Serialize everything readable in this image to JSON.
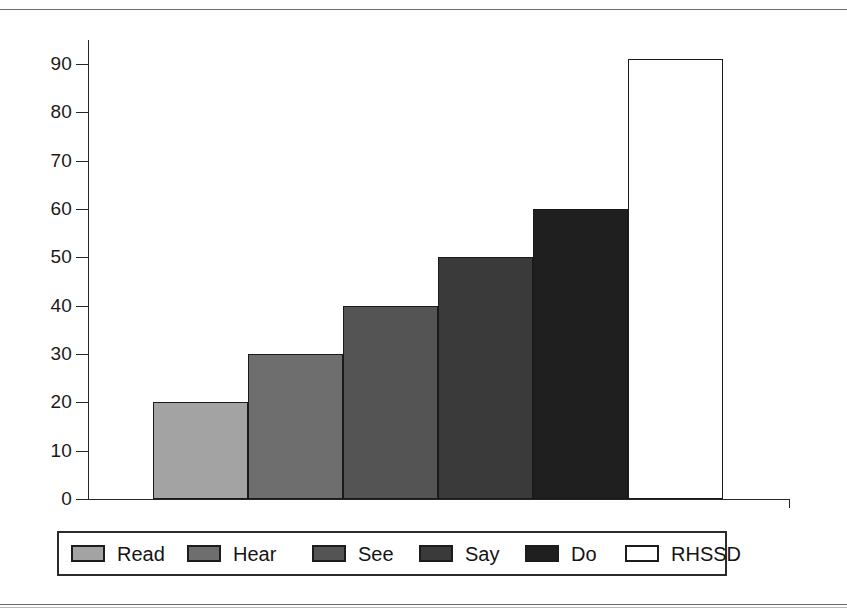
{
  "chart_data": {
    "type": "bar",
    "title": "",
    "subtitle": "",
    "xlabel": "",
    "ylabel": "",
    "categories": [
      "Read",
      "Hear",
      "See",
      "Say",
      "Do",
      "RHSSD"
    ],
    "values": [
      20,
      30,
      40,
      50,
      60,
      91
    ],
    "series": [
      {
        "name": "Retention",
        "values": [
          20,
          30,
          40,
          50,
          60,
          91
        ]
      }
    ],
    "ylim": [
      0,
      95
    ],
    "ytick_labels": [
      "0",
      "10",
      "20",
      "30",
      "40",
      "50",
      "60",
      "70",
      "80",
      "90"
    ],
    "ytick_values": [
      0,
      10,
      20,
      30,
      40,
      50,
      60,
      70,
      80,
      90
    ],
    "xtick_labels": [],
    "grid": false,
    "legend_position": "bottom",
    "bar_colors": [
      "#a3a3a3",
      "#6e6e6e",
      "#545454",
      "#3a3a3a",
      "#1f1f1f",
      "#ffffff"
    ],
    "bar_edge_color": "#1a1a1a",
    "axis_color": "#262626"
  },
  "legend": {
    "items": [
      {
        "label": "Read",
        "swatch": "legend-swatch-read",
        "color": "#a3a3a3"
      },
      {
        "label": "Hear",
        "swatch": "legend-swatch-hear",
        "color": "#6e6e6e"
      },
      {
        "label": "See",
        "swatch": "legend-swatch-see",
        "color": "#545454"
      },
      {
        "label": "Say",
        "swatch": "legend-swatch-say",
        "color": "#3a3a3a"
      },
      {
        "label": "Do",
        "swatch": "legend-swatch-do",
        "color": "#1f1f1f"
      },
      {
        "label": "RHSSD",
        "swatch": "legend-swatch-rhssd",
        "color": "#ffffff"
      }
    ]
  },
  "axis": {
    "y_ticks": [
      {
        "label": "90",
        "value": 90
      },
      {
        "label": "80",
        "value": 80
      },
      {
        "label": "70",
        "value": 70
      },
      {
        "label": "60",
        "value": 60
      },
      {
        "label": "50",
        "value": 50
      },
      {
        "label": "40",
        "value": 40
      },
      {
        "label": "30",
        "value": 30
      },
      {
        "label": "20",
        "value": 20
      },
      {
        "label": "10",
        "value": 10
      },
      {
        "label": "0",
        "value": 0
      }
    ]
  }
}
